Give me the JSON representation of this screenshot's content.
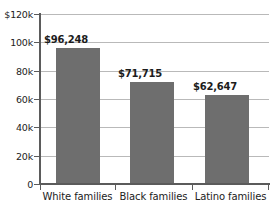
{
  "chart_data": {
    "type": "bar",
    "title": "",
    "subtitle": "",
    "xlabel": "",
    "ylabel": "",
    "categories": [
      "White families",
      "Black families",
      "Latino families"
    ],
    "values": [
      96248,
      71715,
      62647
    ],
    "data_labels": [
      "$96,248",
      "$71,715",
      "$62,647"
    ],
    "ylim": [
      0,
      120000
    ],
    "ytick_values": [
      0,
      20000,
      40000,
      60000,
      80000,
      100000,
      120000
    ],
    "ytick_labels": [
      "0",
      "20k",
      "40k",
      "60k",
      "80k",
      "100k",
      "$120k"
    ],
    "grid": true,
    "legend": false,
    "legend_position": "none",
    "series": [
      {
        "name": "",
        "values": [
          96248,
          71715,
          62647
        ]
      }
    ]
  },
  "style": {
    "bar_color": "#6e6e6e",
    "grid_color": "#b9b9b9",
    "axis_color": "#5b5b5b",
    "text_color": "#222222",
    "value_text_color": "#1c1c1c",
    "background": "#ffffff"
  }
}
